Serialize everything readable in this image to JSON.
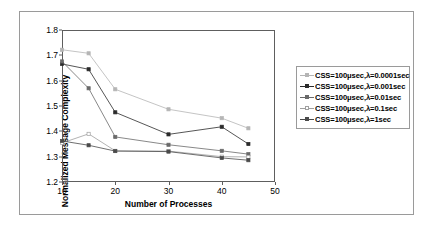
{
  "figure": {
    "xlabel": "Number of Processes",
    "ylabel": "Normalized Message Complexity"
  },
  "axes": {
    "yticks": [
      "1.2",
      "1.3",
      "1.4",
      "1.5",
      "1.6",
      "1.7",
      "1.8"
    ],
    "xticks": [
      "10",
      "20",
      "30",
      "40",
      "50"
    ]
  },
  "legend": {
    "items": [
      {
        "label": "CSS=100μsec,λ=0.0001sec",
        "color": "#b5b5b5",
        "marker": "square"
      },
      {
        "label": "CSS=100μsec,λ=0.001sec",
        "color": "#2b2b2b",
        "marker": "square"
      },
      {
        "label": "CSS=100μsec,λ=0.01sec",
        "color": "#6a6a6a",
        "marker": "square"
      },
      {
        "label": "CSS=100μsec,λ=0.1sec",
        "color": "#a0a0a0",
        "marker": "square-open"
      },
      {
        "label": "CSS=100μsec,λ=1sec",
        "color": "#4a4a4a",
        "marker": "square"
      }
    ]
  },
  "chart_data": {
    "type": "line",
    "title": "",
    "xlabel": "Number of Processes",
    "ylabel": "Normalized Message Complexity",
    "xlim": [
      10,
      50
    ],
    "ylim": [
      1.2,
      1.8
    ],
    "xticks": [
      10,
      20,
      30,
      40,
      50
    ],
    "yticks": [
      1.2,
      1.3,
      1.4,
      1.5,
      1.6,
      1.7,
      1.8
    ],
    "grid": false,
    "legend_position": "right-outside",
    "x": [
      10,
      15,
      20,
      30,
      40,
      45
    ],
    "series": [
      {
        "name": "CSS=100μsec,λ=0.0001sec",
        "color": "#b5b5b5",
        "values": [
          1.722,
          1.708,
          1.566,
          1.487,
          1.452,
          1.412
        ]
      },
      {
        "name": "CSS=100μsec,λ=0.001sec",
        "color": "#2b2b2b",
        "values": [
          1.666,
          1.645,
          1.475,
          1.388,
          1.418,
          1.35
        ]
      },
      {
        "name": "CSS=100μsec,λ=0.01sec",
        "color": "#6a6a6a",
        "values": [
          1.676,
          1.57,
          1.378,
          1.347,
          1.323,
          1.31
        ]
      },
      {
        "name": "CSS=100μsec,λ=0.1sec",
        "color": "#a0a0a0",
        "values": [
          1.354,
          1.39,
          1.323,
          1.322,
          1.3,
          1.299
        ]
      },
      {
        "name": "CSS=100μsec,λ=1sec",
        "color": "#4a4a4a",
        "values": [
          1.362,
          1.345,
          1.322,
          1.32,
          1.295,
          1.286
        ]
      }
    ]
  }
}
